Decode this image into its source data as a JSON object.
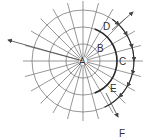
{
  "diagram": {
    "type": "polar-grid",
    "center": {
      "x": 83,
      "y": 61
    },
    "circle_radii": [
      17,
      34,
      51
    ],
    "radial_line_length": 60,
    "radial_step_deg": 15,
    "colors": {
      "line": "#6a6a6a",
      "bold": "#2a2a2a",
      "text": "#333333",
      "background": "#ffffff"
    },
    "labels": {
      "A": "A",
      "B": "B",
      "C": "C",
      "D": "D",
      "E": "E",
      "F": "F"
    },
    "label_positions": {
      "A": {
        "x": 79,
        "y": 65
      },
      "B": {
        "x": 97,
        "y": 52
      },
      "C": {
        "x": 119,
        "y": 65
      },
      "D": {
        "x": 103,
        "y": 30
      },
      "E": {
        "x": 110,
        "y": 92
      },
      "F": {
        "x": 119,
        "y": 137
      }
    },
    "arrows": [
      {
        "name": "arrow-left",
        "from": [
          83,
          61
        ],
        "to": [
          8,
          40
        ]
      },
      {
        "name": "arrow-top-right",
        "from": [
          112,
          30
        ],
        "to": [
          133,
          12
        ]
      },
      {
        "name": "arrow-F",
        "from": [
          106,
          93
        ],
        "to": [
          118,
          117
        ]
      }
    ]
  }
}
